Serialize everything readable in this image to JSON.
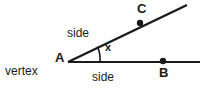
{
  "diagram": {
    "background_color": "#ffffff",
    "stroke_color": "#1a1a1a",
    "labels": {
      "vertex": "vertex",
      "point_a": "A",
      "point_b": "B",
      "point_c": "C",
      "side_upper": "side",
      "side_lower": "side",
      "angle": "x"
    },
    "geometry": {
      "vertex_point": {
        "x": 68,
        "y": 62
      },
      "ray_lower_end": {
        "x": 200,
        "y": 62
      },
      "ray_upper_end": {
        "x": 187,
        "y": 5
      },
      "point_b_dot": {
        "x": 163,
        "y": 61
      },
      "point_c_dot": {
        "x": 140,
        "y": 23
      },
      "arc_radius": 32,
      "angle_degrees": 23
    }
  }
}
